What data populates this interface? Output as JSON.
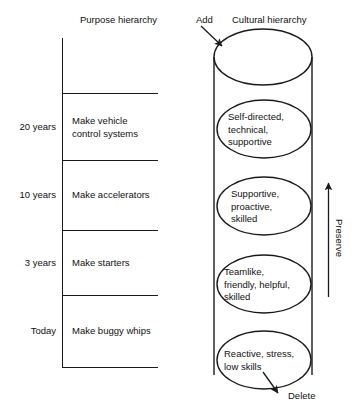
{
  "figure": {
    "left_column_header": "Purpose hierarchy",
    "right_column_header": "Cultural hierarchy",
    "add_label": "Add",
    "delete_label": "Delete",
    "preserve_label": "Preserve"
  },
  "purpose_hierarchy": {
    "rows": [
      {
        "timeframe": "20 years",
        "purpose": "Make vehicle\ncontrol systems"
      },
      {
        "timeframe": "10 years",
        "purpose": "Make accelerators"
      },
      {
        "timeframe": "3 years",
        "purpose": "Make starters"
      },
      {
        "timeframe": "Today",
        "purpose": "Make buggy whips"
      }
    ]
  },
  "cultural_hierarchy": {
    "levels": [
      {
        "traits": "Self-directed,\ntechnical,\nsupportive"
      },
      {
        "traits": "Supportive,\nproactive,\nskilled"
      },
      {
        "traits": "Teamlike,\nfriendly, helpful,\nskilled"
      },
      {
        "traits": "Reactive, stress,\nlow skills"
      }
    ]
  },
  "colors": {
    "stroke": "#1a1a1a",
    "text": "#111111",
    "background": "#ffffff"
  }
}
